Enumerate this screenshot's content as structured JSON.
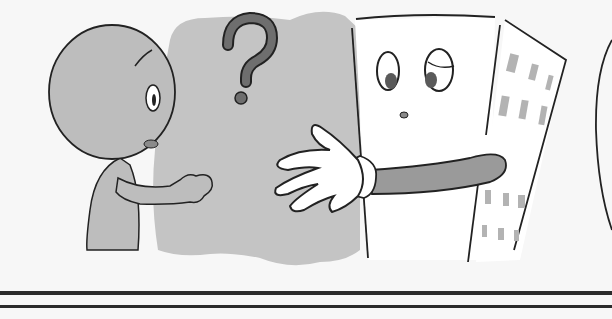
{
  "illustration": {
    "description": "Cartoon: a bald child reaching toward a smiling office-building character offering a gloved hand, with a question mark above",
    "symbol": "?",
    "colors": {
      "background": "#f7f7f7",
      "figure_gray": "#bdbdbd",
      "cloud_gray": "#c4c4c4",
      "question_mark": "#6e6e6e",
      "outline": "#222222",
      "building_white": "#ffffff",
      "window_gray": "#b3b3b3",
      "arm_gray": "#9a9a9a",
      "rule": "#2b2b2b"
    },
    "characters": [
      {
        "name": "child",
        "pose": "reaching with right hand"
      },
      {
        "name": "building",
        "pose": "extending gloved hand",
        "windows_left_face": 0,
        "windows_right_face": 12
      }
    ]
  }
}
